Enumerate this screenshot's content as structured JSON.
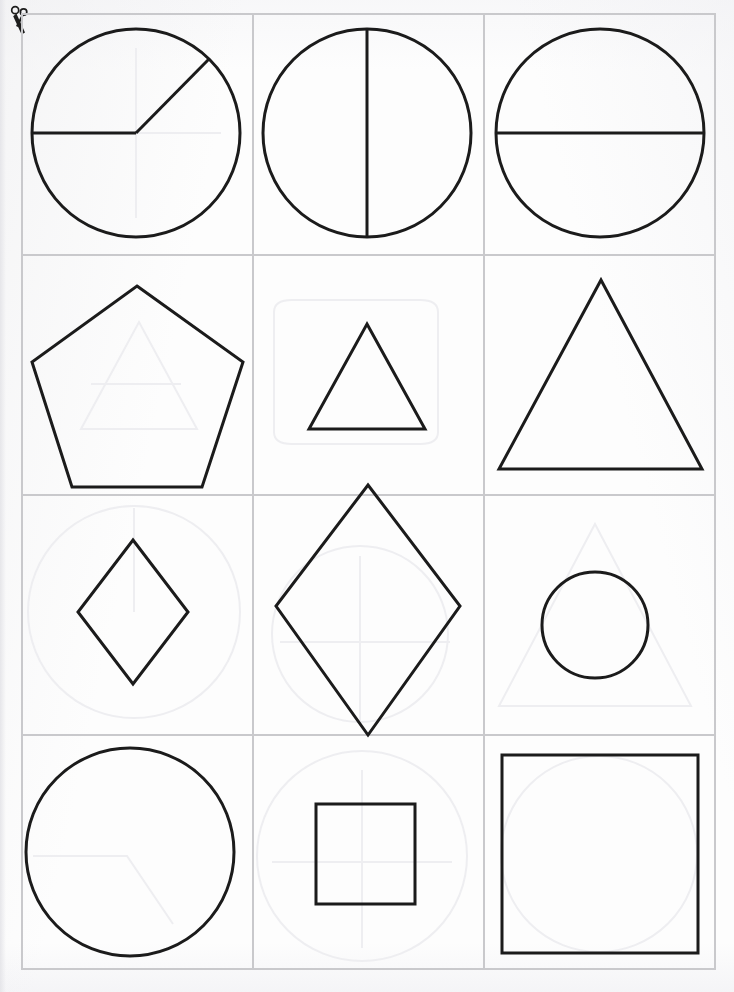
{
  "page": {
    "width": 734,
    "height": 992,
    "background_color": "#fdfdfd",
    "shape_outline_color": "#1b1b1b",
    "grid_line_color": "#c9c9cc",
    "ghost_outline_color": "#eeeef1"
  },
  "cut_marker": {
    "icon": "scissors-icon",
    "label": "Cut along the lines"
  },
  "grid": {
    "columns": 3,
    "rows": 4,
    "left": 21,
    "top": 13,
    "width": 695,
    "height": 957,
    "column_x": [
      0,
      231,
      462,
      695
    ],
    "row_y": [
      0,
      241,
      481,
      721,
      957
    ]
  },
  "cells": [
    {
      "index": 1,
      "row": 1,
      "column": 1,
      "shape": "circle-with-two-radii",
      "shape_label": "Circle divided by two radii",
      "size": "large",
      "fill": "none",
      "notes": "One radius points left (180 degrees), one points to the upper right (about 48 degrees)"
    },
    {
      "index": 2,
      "row": 1,
      "column": 2,
      "shape": "circle-with-vertical-diameter",
      "shape_label": "Circle split in half vertically",
      "size": "large",
      "fill": "none",
      "notes": "Vertical diameter line from top to bottom"
    },
    {
      "index": 3,
      "row": 1,
      "column": 3,
      "shape": "circle-with-horizontal-diameter",
      "shape_label": "Circle split in half horizontally",
      "size": "large",
      "fill": "none",
      "notes": "Horizontal diameter line from left to right"
    },
    {
      "index": 4,
      "row": 2,
      "column": 1,
      "shape": "pentagon",
      "shape_label": "Regular pentagon",
      "size": "large",
      "fill": "none",
      "notes": "Point up, flat bottom edge"
    },
    {
      "index": 5,
      "row": 2,
      "column": 2,
      "shape": "triangle",
      "shape_label": "Equilateral triangle",
      "size": "small",
      "fill": "none",
      "notes": "Point up, centered low in the cell"
    },
    {
      "index": 6,
      "row": 2,
      "column": 3,
      "shape": "triangle",
      "shape_label": "Equilateral triangle",
      "size": "large",
      "fill": "none",
      "notes": "Point up, nearly fills the cell"
    },
    {
      "index": 7,
      "row": 3,
      "column": 1,
      "shape": "diamond",
      "shape_label": "Diamond (square rotated 45 degrees)",
      "size": "small",
      "fill": "none",
      "notes": "Faint circle bleeding through from the reverse side"
    },
    {
      "index": 8,
      "row": 3,
      "column": 2,
      "shape": "diamond",
      "shape_label": "Diamond (square rotated 45 degrees)",
      "size": "large",
      "fill": "none",
      "notes": "Overflows above and below the cell boundaries"
    },
    {
      "index": 9,
      "row": 3,
      "column": 3,
      "shape": "circle",
      "shape_label": "Circle",
      "size": "small",
      "fill": "none",
      "notes": "Faint triangle bleeding through from the reverse side"
    },
    {
      "index": 10,
      "row": 4,
      "column": 1,
      "shape": "circle",
      "shape_label": "Circle",
      "size": "large",
      "fill": "none",
      "notes": "Plain undivided circle"
    },
    {
      "index": 11,
      "row": 4,
      "column": 2,
      "shape": "square",
      "shape_label": "Square",
      "size": "small",
      "fill": "none",
      "notes": "Faint circle bleeding through from the reverse side"
    },
    {
      "index": 12,
      "row": 4,
      "column": 3,
      "shape": "square",
      "shape_label": "Square",
      "size": "large",
      "fill": "none",
      "notes": "Nearly fills the cell"
    }
  ]
}
